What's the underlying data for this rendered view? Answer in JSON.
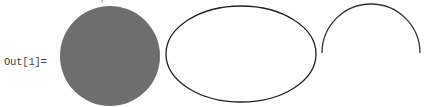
{
  "notebook": {
    "input_fragment": "·  ·  ·, ·  ·  ·",
    "output_label": "Out[1]=",
    "graphics": [
      {
        "kind": "disk",
        "cx": 110,
        "cy": 56,
        "r": 50,
        "fill": "#6e6e6e"
      },
      {
        "kind": "ellipse",
        "cx": 241,
        "cy": 54,
        "rx": 75,
        "ry": 48,
        "stroke": "#222222"
      },
      {
        "kind": "arc",
        "cx": 371,
        "cy": 53,
        "r": 49,
        "from_deg": 0,
        "to_deg": 180,
        "stroke": "#333333"
      }
    ]
  }
}
